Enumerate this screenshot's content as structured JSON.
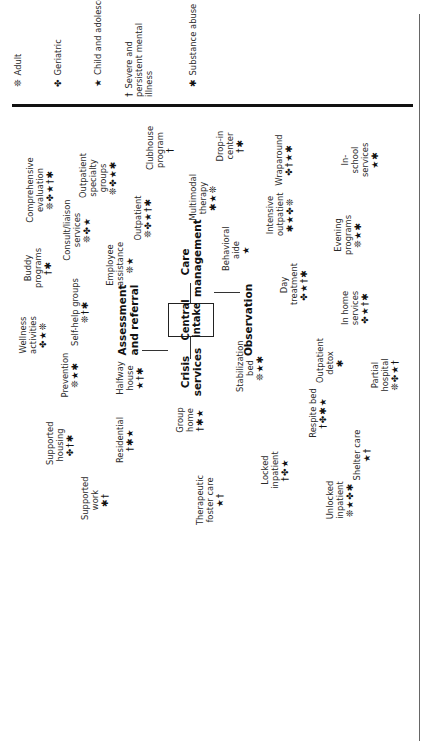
{
  "legend": {
    "items": [
      {
        "symbol": "❊",
        "label": "Adult"
      },
      {
        "symbol": "✤",
        "label": "Geriatric"
      },
      {
        "symbol": "★",
        "label": "Child and adolescent"
      },
      {
        "symbol": "†",
        "label": "Severe and persistent mental illness"
      },
      {
        "symbol": "✱",
        "label": "Substance abuse"
      }
    ]
  },
  "center": {
    "label_line1": "Central",
    "label_line2": "intake"
  },
  "hubs": {
    "assessment": "Assessment and referral",
    "care": "Care management",
    "crisis": "Crisis services",
    "observation": "Observation"
  },
  "services": [
    {
      "name": "Comprehensive evaluation",
      "symbols": "❊✤★†✱"
    },
    {
      "name": "Outpatient specialty groups",
      "symbols": "❊✤★✱"
    },
    {
      "name": "Clubhouse program",
      "symbols": "†"
    },
    {
      "name": "Drop-in center",
      "symbols": "†✱"
    },
    {
      "name": "Wraparound",
      "symbols": "✤†★✱"
    },
    {
      "name": "In-school services",
      "symbols": "★✱"
    },
    {
      "name": "Consult/liaison services",
      "symbols": "❊✤★"
    },
    {
      "name": "Outpatient",
      "symbols": "❊✤★†✱"
    },
    {
      "name": "Multimodal therapy",
      "symbols": "✱★❊"
    },
    {
      "name": "Intensive outpatient",
      "symbols": "✱★✤❊"
    },
    {
      "name": "Buddy programs",
      "symbols": "†✱"
    },
    {
      "name": "Employee assistance",
      "symbols": "❊★"
    },
    {
      "name": "Behavioral aide",
      "symbols": "★"
    },
    {
      "name": "Evening programs",
      "symbols": "❊★✱"
    },
    {
      "name": "Day treatment",
      "symbols": "✤★†✱"
    },
    {
      "name": "In home services",
      "symbols": "✤★†✱"
    },
    {
      "name": "Wellness activities",
      "symbols": "✤★❊"
    },
    {
      "name": "Self-help groups",
      "symbols": "❊†✱"
    },
    {
      "name": "Prevention",
      "symbols": "❊★✱"
    },
    {
      "name": "Halfway house",
      "symbols": "★†✱"
    },
    {
      "name": "Stabilization bed",
      "symbols": "❊★✱"
    },
    {
      "name": "Outpatient detox",
      "symbols": "✱"
    },
    {
      "name": "Partial hospital",
      "symbols": "❊✤★†"
    },
    {
      "name": "Supported housing",
      "symbols": "✤†✱"
    },
    {
      "name": "Residential",
      "symbols": "†✱★"
    },
    {
      "name": "Group home",
      "symbols": "†✱★"
    },
    {
      "name": "Respite bed",
      "symbols": "†✤✱★"
    },
    {
      "name": "Shelter care",
      "symbols": "★†"
    },
    {
      "name": "Locked inpatient",
      "symbols": "†✤★"
    },
    {
      "name": "Supported work",
      "symbols": "✱†"
    },
    {
      "name": "Therapeutic foster care",
      "symbols": "★†"
    },
    {
      "name": "Unlocked inpatient",
      "symbols": "❊★✤✱"
    }
  ]
}
